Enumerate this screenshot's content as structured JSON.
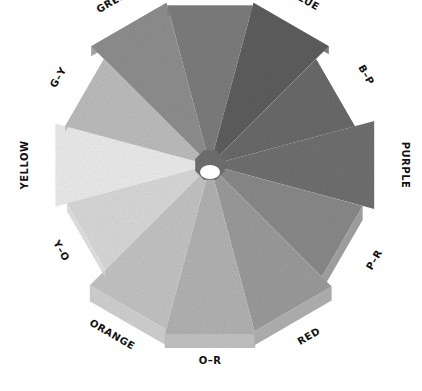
{
  "segments": [
    {
      "label": "YELLOW",
      "shade": "#ececec"
    },
    {
      "label": "G-Y",
      "shade": "#bdbdbd"
    },
    {
      "label": "GREEN",
      "shade": "#8f8f8f"
    },
    {
      "label": "G-B",
      "shade": "#7d7d7d"
    },
    {
      "label": "BLUE",
      "shade": "#5e5e5e"
    },
    {
      "label": "B-P",
      "shade": "#6a6a6a"
    },
    {
      "label": "PURPLE",
      "shade": "#707070"
    },
    {
      "label": "P-R",
      "shade": "#8a8a8a"
    },
    {
      "label": "RED",
      "shade": "#9c9c9c"
    },
    {
      "label": "O-R",
      "shade": "#b3b3b3"
    },
    {
      "label": "ORANGE",
      "shade": "#c4c4c4"
    },
    {
      "label": "Y-O",
      "shade": "#d9d9d9"
    }
  ],
  "hub": {
    "shade": "#6b6b6b",
    "hole": "#ffffff"
  }
}
